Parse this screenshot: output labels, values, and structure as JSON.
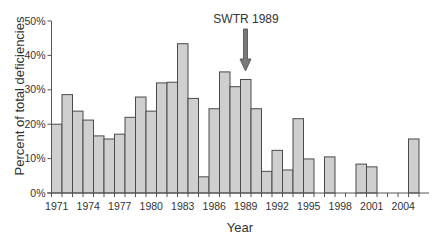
{
  "chart_data": {
    "type": "bar",
    "title": "",
    "xlabel": "Year",
    "ylabel": "Percent of total deficiencies",
    "ylim": [
      0,
      50
    ],
    "yticks": [
      "0%",
      "10%",
      "20%",
      "30%",
      "40%",
      "50%"
    ],
    "xtick_labels": [
      "1971",
      "1974",
      "1977",
      "1980",
      "1983",
      "1986",
      "1989",
      "1992",
      "1995",
      "1998",
      "2001",
      "2004"
    ],
    "grid": false,
    "legend": null,
    "categories": [
      "1971",
      "1972",
      "1973",
      "1974",
      "1975",
      "1976",
      "1977",
      "1978",
      "1979",
      "1980",
      "1981",
      "1982",
      "1983",
      "1984",
      "1985",
      "1986",
      "1987",
      "1988",
      "1989",
      "1990",
      "1991",
      "1992",
      "1993",
      "1994",
      "1995",
      "1996",
      "1997",
      "1998",
      "1999",
      "2000",
      "2001",
      "2002",
      "2003",
      "2004",
      "2005"
    ],
    "values": [
      20.0,
      28.6,
      23.8,
      21.2,
      16.6,
      15.7,
      17.1,
      22.0,
      27.9,
      23.8,
      32.0,
      32.2,
      43.4,
      27.5,
      4.7,
      24.5,
      35.2,
      30.9,
      33.0,
      24.5,
      6.3,
      12.4,
      6.7,
      21.6,
      9.9,
      0,
      10.5,
      0,
      0,
      8.4,
      7.6,
      0,
      0,
      0,
      15.7
    ],
    "annotations": [
      {
        "text": "SWTR 1989",
        "target_category": "1989",
        "type": "downward-arrow"
      }
    ],
    "colors": {
      "bar_fill": "#cfcfcf",
      "bar_stroke": "#4a4a4a",
      "arrow_fill": "#7a7a7a"
    }
  }
}
